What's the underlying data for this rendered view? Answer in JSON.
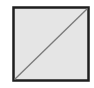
{
  "figure": {
    "shape": "square-with-diagonal",
    "colors": {
      "background": "#ffffff",
      "fill": "#e5e5e5",
      "border": "#1e1e1e",
      "diagonal": "#7a7a7a"
    },
    "diagonal_direction": "bottom-left-to-top-right"
  }
}
